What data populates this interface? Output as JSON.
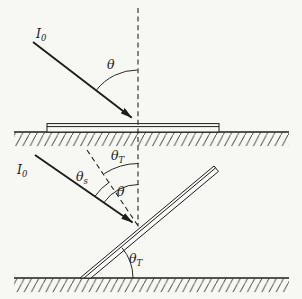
{
  "meta": {
    "ink_color": "#1d1d1b",
    "paper_color": "#f7f7f4"
  },
  "panel_top": {
    "incident_ray_label": {
      "base": "I",
      "sub": "0"
    },
    "incidence_angle_label": {
      "base": "θ",
      "sub": ""
    }
  },
  "panel_bottom": {
    "incident_ray_label": {
      "base": "I",
      "sub": "0"
    },
    "angle_from_surface_normal_label": {
      "base": "θ",
      "sub": "s"
    },
    "tilt_angle_upper_label": {
      "base": "θ",
      "sub": "T"
    },
    "incidence_angle_label": {
      "base": "θ",
      "sub": ""
    },
    "tilt_angle_lower_label": {
      "base": "θ",
      "sub": "T"
    }
  }
}
